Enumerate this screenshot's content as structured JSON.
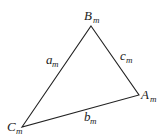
{
  "diagram": {
    "type": "triangle",
    "stroke_color": "#222222",
    "vertices": [
      {
        "id": "B",
        "label": "B",
        "sub": "m",
        "x": 91,
        "y": 26
      },
      {
        "id": "A",
        "label": "A",
        "sub": "m",
        "x": 139,
        "y": 95
      },
      {
        "id": "C",
        "label": "C",
        "sub": "m",
        "x": 22,
        "y": 127
      }
    ],
    "sides": [
      {
        "id": "a",
        "label": "a",
        "sub": "m",
        "between": [
          "B",
          "C"
        ]
      },
      {
        "id": "b",
        "label": "b",
        "sub": "m",
        "between": [
          "C",
          "A"
        ]
      },
      {
        "id": "c",
        "label": "c",
        "sub": "m",
        "between": [
          "B",
          "A"
        ]
      }
    ]
  }
}
